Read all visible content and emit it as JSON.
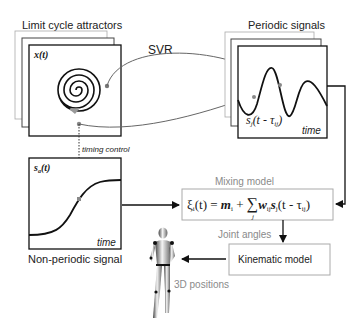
{
  "limit_cycle": {
    "title": "Limit cycle attractors",
    "panel_label": "x(t)"
  },
  "svr": {
    "label": "SVR"
  },
  "periodic": {
    "title": "Periodic signals",
    "signal_label": "s",
    "signal_sub": "j",
    "signal_args": "(t - τ",
    "signal_args_sub": "ij",
    "signal_close": ")",
    "axis_label": "time"
  },
  "timing": {
    "label": "timing control"
  },
  "nonperiodic": {
    "panel_label": "s",
    "panel_sub": "a",
    "panel_args": "(t)",
    "axis_label": "time",
    "title": "Non-periodic signal"
  },
  "mixing": {
    "title": "Mixing model",
    "xi": "ξ",
    "xi_sub": "i",
    "eq_part1": "(t) = ",
    "m": "m",
    "m_sub": "i",
    "plus": " + ",
    "sum": "∑",
    "sum_sub": "j",
    "w": "w",
    "w_sub": "ij",
    "s": "s",
    "s_sub": "j",
    "args": "(t - τ",
    "args_sub": "ij",
    "close": ")"
  },
  "joint_angles": {
    "label": "Joint angles"
  },
  "kinematic": {
    "label": "Kinematic model"
  },
  "positions": {
    "label": "3D positions"
  },
  "colors": {
    "frame_dark": "#1a1a1a",
    "frame_light": "#9a9a9a",
    "arrow_gray": "#666666",
    "marker_gray": "#8c8c8c"
  }
}
